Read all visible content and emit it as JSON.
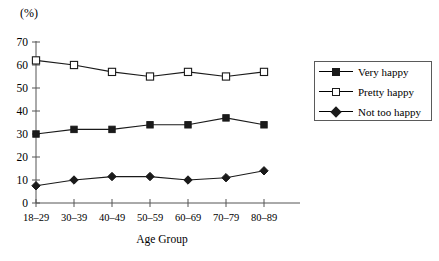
{
  "chart_data": {
    "type": "line",
    "title": "",
    "unit_label": "(%)",
    "xlabel": "Age Group",
    "ylabel": "",
    "categories": [
      "18–29",
      "30–39",
      "40–49",
      "50–59",
      "60–69",
      "70–79",
      "80–89"
    ],
    "ylim": [
      0,
      70
    ],
    "yticks": [
      0,
      10,
      20,
      30,
      40,
      50,
      60,
      70
    ],
    "ytick_labels": [
      "0",
      "10",
      "20",
      "30",
      "40",
      "50",
      "60",
      "70"
    ],
    "grid": false,
    "legend_position": "right",
    "series": [
      {
        "name": "Very happy",
        "marker": "filled-square",
        "color": "#1a1a1a",
        "values": [
          30,
          32,
          32,
          34,
          34,
          37,
          34
        ]
      },
      {
        "name": "Pretty happy",
        "marker": "open-square",
        "color": "#1a1a1a",
        "values": [
          62,
          60,
          57,
          55,
          57,
          55,
          57
        ]
      },
      {
        "name": "Not too happy",
        "marker": "filled-diamond",
        "color": "#1a1a1a",
        "values": [
          7.5,
          10,
          11.5,
          11.5,
          10,
          11,
          14
        ]
      }
    ]
  },
  "legend": {
    "items": [
      {
        "label": "Very happy"
      },
      {
        "label": "Pretty happy"
      },
      {
        "label": "Not too happy"
      }
    ]
  },
  "axis": {
    "unit": "(%)",
    "x_title": "Age Group"
  }
}
